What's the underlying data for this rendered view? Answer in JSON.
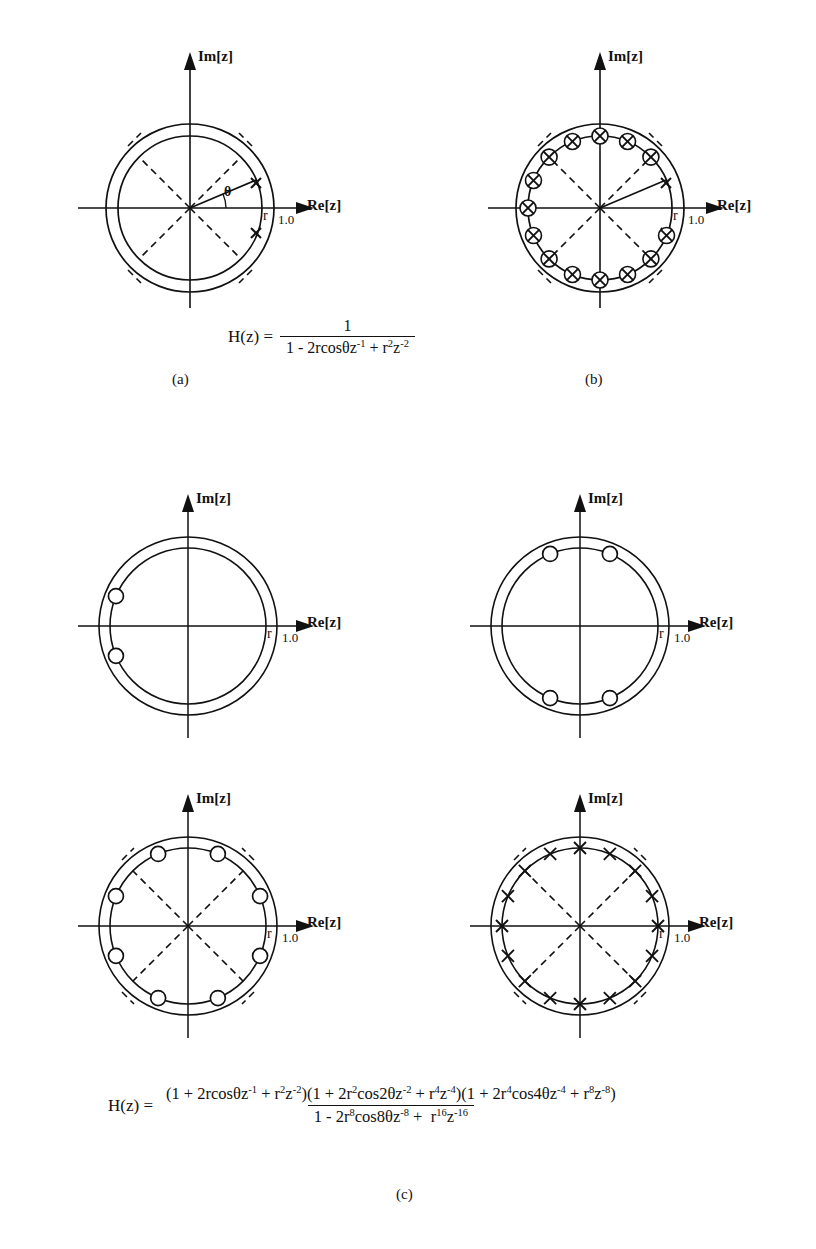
{
  "figure": {
    "axis_labels": {
      "real": "Re[z]",
      "imag": "Im[z]"
    },
    "radius_tick": "r",
    "unit_circle_tick": "1.0",
    "theta_symbol": "θ"
  },
  "captions": {
    "a": "(a)",
    "b": "(b)",
    "c": "(c)"
  },
  "equations": {
    "a": {
      "lhs": "H(z) =",
      "numerator": "1",
      "denominator_parts": [
        {
          "text": "1 - 2rcosθz"
        },
        {
          "sup": "-1"
        },
        {
          "text": " + r"
        },
        {
          "sup": "2"
        },
        {
          "text": "z"
        },
        {
          "sup": "-2"
        }
      ],
      "plain": "H(z) = 1 / (1 - 2rcosθz^-1 + r^2z^-2)"
    },
    "c": {
      "lhs": "H(z) =",
      "numerator_plain": "(1 + 2rcosθz^-1 + r^2z^-2)(1 + 2r^2cos2θz^-2 + r^4z^-4)(1 + 2r^4cos4θz^-4 + r^8z^-8)",
      "denominator_plain": "1 - 2r^8cos8θz^-8 + r^16z^-16"
    }
  },
  "chart_data": {
    "type": "scatter",
    "xlabel": "Re[z]",
    "ylabel": "Im[z]",
    "marker_legend": {
      "x": "pole",
      "open-circle": "zero",
      "circled-x": "pole-zero pair"
    },
    "panels": [
      {
        "id": "a",
        "caption": "(a)",
        "circles": [
          {
            "name": "unit-circle",
            "radius": 1.0,
            "style": "solid"
          },
          {
            "name": "radius-r-circle",
            "radius": 0.86,
            "style": "solid"
          }
        ],
        "dashed_diagonals_deg": [
          45,
          135,
          225,
          315
        ],
        "radius_line_angle_deg": 22.5,
        "annotations": [
          "θ",
          "r",
          "1.0"
        ],
        "markers": [
          {
            "type": "x",
            "angle_deg": 22.5,
            "radius": 0.86
          },
          {
            "type": "x",
            "angle_deg": -22.5,
            "radius": 0.86
          }
        ]
      },
      {
        "id": "b",
        "caption": "(b)",
        "circles": [
          {
            "name": "unit-circle",
            "radius": 1.0,
            "style": "solid"
          },
          {
            "name": "radius-r-circle",
            "radius": 0.86,
            "style": "solid"
          }
        ],
        "dashed_diagonals_deg": [
          45,
          135,
          225,
          315
        ],
        "radius_line_angle_deg": 22.5,
        "annotations": [
          "r",
          "1.0"
        ],
        "markers": [
          {
            "type": "x",
            "angle_deg": 22.5,
            "radius": 0.86
          },
          {
            "type": "x",
            "angle_deg": -22.5,
            "radius": 0.86
          },
          {
            "type": "circled-x",
            "angle_deg": 67.5,
            "radius": 0.86
          },
          {
            "type": "circled-x",
            "angle_deg": 90,
            "radius": 0.86
          },
          {
            "type": "circled-x",
            "angle_deg": 112.5,
            "radius": 0.86
          },
          {
            "type": "circled-x",
            "angle_deg": 45,
            "radius": 0.86
          },
          {
            "type": "circled-x",
            "angle_deg": 135,
            "radius": 0.86
          },
          {
            "type": "circled-x",
            "angle_deg": 157.5,
            "radius": 0.86
          },
          {
            "type": "circled-x",
            "angle_deg": 180,
            "radius": 0.86
          },
          {
            "type": "circled-x",
            "angle_deg": 202.5,
            "radius": 0.86
          },
          {
            "type": "circled-x",
            "angle_deg": 225,
            "radius": 0.86
          },
          {
            "type": "circled-x",
            "angle_deg": 247.5,
            "radius": 0.86
          },
          {
            "type": "circled-x",
            "angle_deg": 270,
            "radius": 0.86
          },
          {
            "type": "circled-x",
            "angle_deg": 292.5,
            "radius": 0.86
          },
          {
            "type": "circled-x",
            "angle_deg": 315,
            "radius": 0.86
          },
          {
            "type": "circled-x",
            "angle_deg": 337.5,
            "radius": 0.86
          }
        ]
      },
      {
        "id": "c1",
        "caption": "",
        "circles": [
          {
            "name": "unit-circle",
            "radius": 1.0,
            "style": "solid"
          },
          {
            "name": "radius-r-circle",
            "radius": 0.88,
            "style": "solid"
          }
        ],
        "dashed_diagonals_deg": [],
        "annotations": [
          "r",
          "1.0"
        ],
        "markers": [
          {
            "type": "open-circle",
            "angle_deg": 157.5,
            "radius": 0.88
          },
          {
            "type": "open-circle",
            "angle_deg": 202.5,
            "radius": 0.88
          }
        ]
      },
      {
        "id": "c2",
        "caption": "",
        "circles": [
          {
            "name": "unit-circle",
            "radius": 1.0,
            "style": "solid"
          },
          {
            "name": "radius-r-circle",
            "radius": 0.88,
            "style": "solid"
          }
        ],
        "dashed_diagonals_deg": [],
        "annotations": [
          "r",
          "1.0"
        ],
        "markers": [
          {
            "type": "open-circle",
            "angle_deg": 67.5,
            "radius": 0.88
          },
          {
            "type": "open-circle",
            "angle_deg": 112.5,
            "radius": 0.88
          },
          {
            "type": "open-circle",
            "angle_deg": 247.5,
            "radius": 0.88
          },
          {
            "type": "open-circle",
            "angle_deg": 292.5,
            "radius": 0.88
          }
        ]
      },
      {
        "id": "c3",
        "caption": "",
        "circles": [
          {
            "name": "unit-circle",
            "radius": 1.0,
            "style": "solid"
          },
          {
            "name": "radius-r-circle",
            "radius": 0.88,
            "style": "solid"
          }
        ],
        "dashed_diagonals_deg": [
          45,
          135,
          225,
          315
        ],
        "annotations": [
          "r",
          "1.0"
        ],
        "markers": [
          {
            "type": "open-circle",
            "angle_deg": 22.5,
            "radius": 0.88
          },
          {
            "type": "open-circle",
            "angle_deg": 67.5,
            "radius": 0.88
          },
          {
            "type": "open-circle",
            "angle_deg": 112.5,
            "radius": 0.88
          },
          {
            "type": "open-circle",
            "angle_deg": 157.5,
            "radius": 0.88
          },
          {
            "type": "open-circle",
            "angle_deg": 202.5,
            "radius": 0.88
          },
          {
            "type": "open-circle",
            "angle_deg": 247.5,
            "radius": 0.88
          },
          {
            "type": "open-circle",
            "angle_deg": 292.5,
            "radius": 0.88
          },
          {
            "type": "open-circle",
            "angle_deg": 337.5,
            "radius": 0.88
          }
        ]
      },
      {
        "id": "c4",
        "caption": "",
        "circles": [
          {
            "name": "unit-circle",
            "radius": 1.0,
            "style": "solid"
          },
          {
            "name": "radius-r-circle",
            "radius": 0.88,
            "style": "solid"
          }
        ],
        "dashed_diagonals_deg": [
          45,
          135,
          225,
          315
        ],
        "annotations": [
          "r",
          "1.0"
        ],
        "markers": [
          {
            "type": "x",
            "angle_deg": 0,
            "radius": 0.88
          },
          {
            "type": "x",
            "angle_deg": 22.5,
            "radius": 0.88
          },
          {
            "type": "x",
            "angle_deg": 45,
            "radius": 0.88
          },
          {
            "type": "x",
            "angle_deg": 67.5,
            "radius": 0.88
          },
          {
            "type": "x",
            "angle_deg": 90,
            "radius": 0.88
          },
          {
            "type": "x",
            "angle_deg": 112.5,
            "radius": 0.88
          },
          {
            "type": "x",
            "angle_deg": 135,
            "radius": 0.88
          },
          {
            "type": "x",
            "angle_deg": 157.5,
            "radius": 0.88
          },
          {
            "type": "x",
            "angle_deg": 180,
            "radius": 0.88
          },
          {
            "type": "x",
            "angle_deg": 202.5,
            "radius": 0.88
          },
          {
            "type": "x",
            "angle_deg": 225,
            "radius": 0.88
          },
          {
            "type": "x",
            "angle_deg": 247.5,
            "radius": 0.88
          },
          {
            "type": "x",
            "angle_deg": 270,
            "radius": 0.88
          },
          {
            "type": "x",
            "angle_deg": 292.5,
            "radius": 0.88
          },
          {
            "type": "x",
            "angle_deg": 315,
            "radius": 0.88
          },
          {
            "type": "x",
            "angle_deg": 337.5,
            "radius": 0.88
          }
        ]
      }
    ]
  }
}
